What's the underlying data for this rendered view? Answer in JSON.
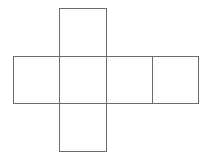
{
  "diagram": {
    "type": "cube-net",
    "stroke_color": "#6b6b6b",
    "background": "#ffffff",
    "faces": [
      {
        "id": "top",
        "x": 59.5,
        "y": 8.5,
        "w": 47,
        "h": 48
      },
      {
        "id": "left",
        "x": 13.5,
        "y": 56.5,
        "w": 46,
        "h": 47
      },
      {
        "id": "center",
        "x": 59.5,
        "y": 56.5,
        "w": 47,
        "h": 47
      },
      {
        "id": "right",
        "x": 106.5,
        "y": 56.5,
        "w": 46,
        "h": 47
      },
      {
        "id": "far-right",
        "x": 152.5,
        "y": 56.5,
        "w": 46,
        "h": 47
      },
      {
        "id": "bottom",
        "x": 59.5,
        "y": 103.5,
        "w": 47,
        "h": 48
      }
    ]
  }
}
